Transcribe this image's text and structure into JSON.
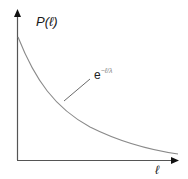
{
  "diagram": {
    "type": "exponential-decay-plot",
    "y_axis_label": "P(ℓ)",
    "x_axis_label": "ℓ",
    "curve_label_base": "e",
    "curve_label_exponent": "−ℓ/λ",
    "colors": {
      "axes": "#555555",
      "curve": "#8a8a8a",
      "leader_line": "#6a6a6a",
      "text": "#1a1a1a"
    }
  }
}
